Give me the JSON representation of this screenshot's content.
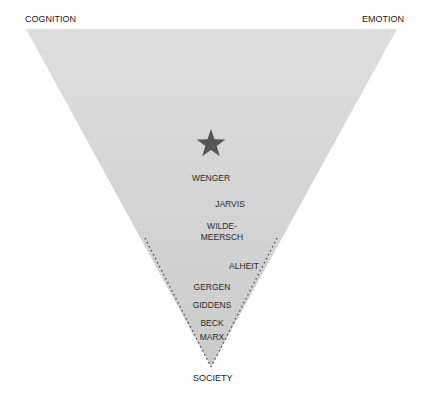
{
  "corners": {
    "top_left": "COGNITION",
    "top_right": "EMOTION",
    "bottom": "SOCIETY"
  },
  "triangle": {
    "fill_top": "#dcdcdc",
    "fill_bottom": "#cdcdcd",
    "dotted_edge_color": "#555555"
  },
  "marker": {
    "icon": "star-icon",
    "color": "#555555"
  },
  "theorists": [
    {
      "name": "WENGER"
    },
    {
      "name": "JARVIS"
    },
    {
      "name": "WILDE-",
      "name2": "MEERSCH"
    },
    {
      "name": "ALHEIT"
    },
    {
      "name": "GERGEN"
    },
    {
      "name": "GIDDENS"
    },
    {
      "name": "BECK"
    },
    {
      "name": "MARX"
    }
  ]
}
